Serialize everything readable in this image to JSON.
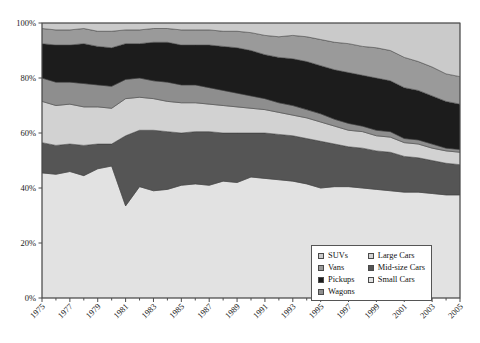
{
  "chart_data": {
    "type": "area",
    "title": "",
    "subtitle": "",
    "xlabel": "",
    "ylabel": "",
    "stacked": true,
    "stack_order_top_to_bottom": [
      "SUVs",
      "Vans",
      "Pickups",
      "Wagons",
      "Large Cars",
      "Mid-size Cars",
      "Small Cars"
    ],
    "grid": false,
    "legend_position": "inside-bottom-right",
    "xlim": [
      1975,
      2005
    ],
    "ylim": [
      0,
      100
    ],
    "ytick_labels": [
      "0%",
      "20%",
      "40%",
      "60%",
      "80%",
      "100%"
    ],
    "ytick_values": [
      0,
      20,
      40,
      60,
      80,
      100
    ],
    "x": [
      1975,
      1976,
      1977,
      1978,
      1979,
      1980,
      1981,
      1982,
      1983,
      1984,
      1985,
      1986,
      1987,
      1988,
      1989,
      1990,
      1991,
      1992,
      1993,
      1994,
      1995,
      1996,
      1997,
      1998,
      1999,
      2000,
      2001,
      2002,
      2003,
      2004,
      2005
    ],
    "xtick_labels": [
      "1975",
      "1977",
      "1979",
      "1981",
      "1983",
      "1985",
      "1987",
      "1989",
      "1991",
      "1993",
      "1995",
      "1997",
      "1999",
      "2001",
      "2003",
      "2005"
    ],
    "categories": [
      1975,
      1976,
      1977,
      1978,
      1979,
      1980,
      1981,
      1982,
      1983,
      1984,
      1985,
      1986,
      1987,
      1988,
      1989,
      1990,
      1991,
      1992,
      1993,
      1994,
      1995,
      1996,
      1997,
      1998,
      1999,
      2000,
      2001,
      2002,
      2003,
      2004,
      2005
    ],
    "series": [
      {
        "name": "Small Cars",
        "color": "#e2e2e2",
        "values": [
          45.5,
          45.0,
          46.0,
          44.5,
          47.0,
          48.0,
          33.5,
          40.5,
          39.0,
          39.5,
          41.0,
          41.5,
          41.0,
          42.5,
          42.0,
          44.0,
          43.5,
          43.0,
          42.5,
          41.5,
          40.0,
          40.5,
          40.5,
          40.0,
          39.5,
          39.0,
          38.5,
          38.5,
          38.0,
          37.5,
          37.5
        ]
      },
      {
        "name": "Mid-size Cars",
        "color": "#555555",
        "values": [
          11.0,
          10.5,
          10.0,
          11.0,
          9.0,
          8.0,
          25.5,
          20.5,
          22.0,
          21.0,
          19.0,
          19.0,
          19.5,
          17.5,
          18.0,
          16.0,
          16.5,
          16.5,
          16.5,
          16.5,
          17.0,
          15.5,
          14.5,
          14.5,
          14.0,
          14.0,
          13.0,
          12.5,
          12.0,
          11.5,
          11.0
        ]
      },
      {
        "name": "Large Cars",
        "color": "#d2d2d2",
        "values": [
          15.0,
          14.5,
          14.5,
          14.0,
          13.5,
          13.0,
          13.5,
          12.0,
          11.5,
          11.0,
          11.0,
          10.5,
          10.0,
          10.0,
          9.5,
          9.0,
          8.5,
          8.0,
          7.5,
          7.5,
          7.0,
          6.5,
          6.0,
          6.0,
          5.5,
          5.5,
          5.0,
          5.0,
          4.5,
          4.5,
          4.5
        ]
      },
      {
        "name": "Wagons",
        "color": "#8e8e8e",
        "values": [
          8.5,
          8.5,
          8.0,
          8.5,
          8.0,
          8.0,
          7.0,
          7.0,
          6.5,
          7.0,
          6.5,
          6.5,
          6.0,
          5.5,
          5.0,
          4.5,
          4.0,
          3.5,
          3.5,
          3.0,
          3.0,
          2.5,
          2.5,
          2.0,
          2.0,
          2.0,
          1.5,
          1.5,
          1.5,
          1.0,
          1.0
        ]
      },
      {
        "name": "Pickups",
        "color": "#1c1c1c",
        "values": [
          12.5,
          13.5,
          13.5,
          14.5,
          14.0,
          14.0,
          13.0,
          12.5,
          14.0,
          14.5,
          14.5,
          14.5,
          15.5,
          16.0,
          16.5,
          16.5,
          16.0,
          16.5,
          17.0,
          17.5,
          17.5,
          18.0,
          18.5,
          18.5,
          19.0,
          18.5,
          18.5,
          18.0,
          17.5,
          17.0,
          16.5
        ]
      },
      {
        "name": "Vans",
        "color": "#9a9a9a",
        "values": [
          5.5,
          5.5,
          5.5,
          5.5,
          5.5,
          6.0,
          5.0,
          5.0,
          5.0,
          5.0,
          5.5,
          5.5,
          5.5,
          5.5,
          6.0,
          6.5,
          7.0,
          7.5,
          8.5,
          9.0,
          9.5,
          10.0,
          10.5,
          10.5,
          11.0,
          11.0,
          11.0,
          10.5,
          10.5,
          10.0,
          10.0
        ]
      },
      {
        "name": "SUVs",
        "color": "#cacaca",
        "values": [
          2.0,
          2.5,
          2.5,
          2.0,
          3.0,
          3.0,
          2.5,
          2.5,
          2.0,
          2.0,
          2.5,
          2.5,
          2.5,
          3.0,
          3.0,
          3.5,
          4.5,
          5.0,
          4.5,
          5.0,
          6.0,
          7.0,
          7.5,
          8.5,
          9.0,
          10.0,
          12.5,
          14.0,
          16.0,
          18.5,
          19.5
        ]
      }
    ]
  },
  "legend": {
    "columns": [
      {
        "items": [
          {
            "label": "SUVs",
            "color": "#cacaca",
            "swatch_name": "legend-swatch-suvs"
          },
          {
            "label": "Vans",
            "color": "#9a9a9a",
            "swatch_name": "legend-swatch-vans"
          },
          {
            "label": "Pickups",
            "color": "#1c1c1c",
            "swatch_name": "legend-swatch-pickups"
          },
          {
            "label": "Wagons",
            "color": "#8e8e8e",
            "swatch_name": "legend-swatch-wagons"
          }
        ]
      },
      {
        "items": [
          {
            "label": "Large Cars",
            "color": "#d2d2d2",
            "swatch_name": "legend-swatch-large-cars"
          },
          {
            "label": "Mid-size Cars",
            "color": "#555555",
            "swatch_name": "legend-swatch-mid-size-cars"
          },
          {
            "label": "Small Cars",
            "color": "#e2e2e2",
            "swatch_name": "legend-swatch-small-cars"
          }
        ]
      }
    ]
  },
  "axes": {
    "frame_color": "#4d4d4d",
    "tick_color": "#4d4d4d",
    "background": "#ffffff"
  }
}
